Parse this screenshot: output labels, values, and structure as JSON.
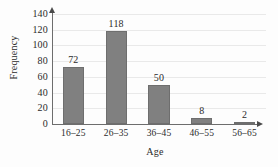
{
  "chart_data": {
    "type": "bar",
    "title": "",
    "xlabel": "Age",
    "ylabel": "Frequency",
    "categories": [
      "16–25",
      "26–35",
      "36–45",
      "46–55",
      "56–65"
    ],
    "values": [
      72,
      118,
      50,
      8,
      2
    ],
    "data_labels": [
      "72",
      "118",
      "50",
      "8",
      "2"
    ],
    "ylim": [
      0,
      140
    ],
    "y_ticks": [
      0,
      20,
      40,
      60,
      80,
      100,
      120,
      140
    ],
    "y_tick_labels": [
      "0",
      "20",
      "40",
      "60",
      "80",
      "100",
      "120",
      "140"
    ],
    "grid": true,
    "grid_axis": "y",
    "legend": null,
    "bar_color": "#808080",
    "bar_edge_color": "#6e6e6e",
    "axis_color": "#6d6d6d",
    "grid_color": "#e9e9e9",
    "text_color": "#2b2b2b",
    "background_color": "#fdfdfd",
    "axis_arrows": {
      "y": "up-arrow-icon",
      "x": "right-arrow-icon"
    }
  }
}
